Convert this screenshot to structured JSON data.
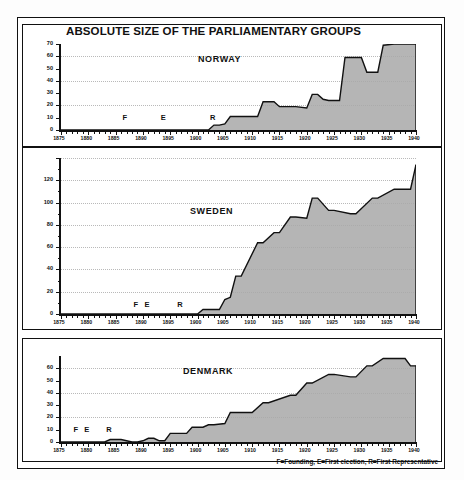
{
  "figure": {
    "title": "ABSOLUTE SIZE OF THE PARLIAMENTARY GROUPS",
    "footnote": "F=Founding, E=First election, R=First Representative",
    "frame_color": "#111111",
    "area_fill": "#a8a8a8",
    "line_color": "#111111",
    "background": "#ffffff"
  },
  "chart_data": [
    {
      "type": "area",
      "title": "ABSOLUTE SIZE OF THE PARLIAMENTARY GROUPS",
      "panel": "NORWAY",
      "xlabel": "",
      "ylabel": "",
      "xlim": [
        1875,
        1940
      ],
      "ylim": [
        0,
        70
      ],
      "yticks": [
        0,
        10,
        20,
        30,
        40,
        50,
        60,
        70
      ],
      "ytick_labels": [
        "0",
        "10",
        "20",
        "30",
        "40",
        "50",
        "60",
        "70"
      ],
      "xticks": [
        1875,
        1880,
        1885,
        1890,
        1895,
        1900,
        1905,
        1910,
        1915,
        1920,
        1925,
        1930,
        1935,
        1940
      ],
      "xtick_labels": [
        "1875",
        "1880",
        "1885",
        "1890",
        "1895",
        "1900",
        "1905",
        "1910",
        "1915",
        "1920",
        "1925",
        "1930",
        "1935",
        "1940"
      ],
      "grid": true,
      "gridlines_at": [
        20,
        40,
        60
      ],
      "annotations": [
        {
          "text": "F",
          "x": 1887,
          "y": 9
        },
        {
          "text": "E",
          "x": 1894,
          "y": 9
        },
        {
          "text": "R",
          "x": 1903,
          "y": 9
        }
      ],
      "x": [
        1875,
        1902,
        1903,
        1904,
        1905,
        1906,
        1909,
        1910,
        1911,
        1912,
        1913,
        1914,
        1915,
        1917,
        1918,
        1920,
        1921,
        1922,
        1923,
        1924,
        1926,
        1927,
        1928,
        1930,
        1931,
        1932,
        1933,
        1934,
        1936,
        1940
      ],
      "values": [
        0,
        0,
        4,
        4,
        5,
        11,
        11,
        11,
        11,
        23,
        23,
        23,
        19,
        19,
        19,
        18,
        29,
        29,
        25,
        24,
        24,
        59,
        59,
        59,
        47,
        47,
        47,
        69,
        70,
        70
      ]
    },
    {
      "type": "area",
      "panel": "SWEDEN",
      "xlabel": "",
      "ylabel": "",
      "xlim": [
        1875,
        1940
      ],
      "ylim": [
        0,
        140
      ],
      "yticks": [
        0,
        20,
        40,
        60,
        80,
        100,
        120,
        140
      ],
      "ytick_labels": [
        "0",
        "20",
        "40",
        "60",
        "80",
        "100",
        "120",
        ""
      ],
      "xticks": [
        1875,
        1880,
        1885,
        1890,
        1895,
        1900,
        1905,
        1910,
        1915,
        1920,
        1925,
        1930,
        1935,
        1940
      ],
      "xtick_labels": [
        "1875",
        "1880",
        "1885",
        "1890",
        "1895",
        "1900",
        "1905",
        "1910",
        "1915",
        "1920",
        "1925",
        "1930",
        "1935",
        "1940"
      ],
      "grid": true,
      "gridlines_at": [
        20,
        40,
        60,
        80,
        100,
        120,
        140
      ],
      "annotations": [
        {
          "text": "F",
          "x": 1889,
          "y": 7
        },
        {
          "text": "E",
          "x": 1891,
          "y": 7
        },
        {
          "text": "R",
          "x": 1897,
          "y": 7
        }
      ],
      "x": [
        1875,
        1900,
        1901,
        1902,
        1904,
        1905,
        1906,
        1907,
        1908,
        1911,
        1912,
        1914,
        1915,
        1917,
        1918,
        1920,
        1921,
        1922,
        1924,
        1925,
        1928,
        1929,
        1932,
        1933,
        1936,
        1937,
        1939,
        1940
      ],
      "values": [
        0,
        0,
        4,
        4,
        4,
        13,
        15,
        34,
        34,
        64,
        64,
        73,
        73,
        87,
        87,
        86,
        104,
        104,
        93,
        93,
        90,
        90,
        104,
        104,
        112,
        112,
        112,
        134
      ]
    },
    {
      "type": "area",
      "panel": "DENMARK",
      "xlabel": "",
      "ylabel": "",
      "xlim": [
        1875,
        1940
      ],
      "ylim": [
        0,
        70
      ],
      "yticks": [
        0,
        10,
        20,
        30,
        40,
        50,
        60
      ],
      "ytick_labels": [
        "0",
        "10",
        "20",
        "30",
        "40",
        "50",
        "60"
      ],
      "xticks": [
        1875,
        1880,
        1885,
        1890,
        1895,
        1900,
        1905,
        1910,
        1915,
        1920,
        1925,
        1930,
        1935,
        1940
      ],
      "xtick_labels": [
        "1875",
        "1880",
        "1885",
        "1890",
        "1895",
        "1900",
        "1905",
        "1910",
        "1915",
        "1920",
        "1925",
        "1930",
        "1935",
        "1940"
      ],
      "grid": true,
      "gridlines_at": [
        20,
        40,
        60
      ],
      "annotations": [
        {
          "text": "F",
          "x": 1878,
          "y": 9
        },
        {
          "text": "E",
          "x": 1880,
          "y": 9
        },
        {
          "text": "R",
          "x": 1884,
          "y": 9
        }
      ],
      "x": [
        1875,
        1883,
        1884,
        1885,
        1886,
        1887,
        1888,
        1889,
        1890,
        1891,
        1892,
        1893,
        1894,
        1895,
        1898,
        1899,
        1901,
        1902,
        1903,
        1905,
        1906,
        1909,
        1910,
        1912,
        1913,
        1917,
        1918,
        1920,
        1921,
        1924,
        1925,
        1928,
        1929,
        1931,
        1932,
        1934,
        1935,
        1938,
        1939,
        1940
      ],
      "values": [
        0,
        0,
        2,
        2,
        2,
        1,
        0,
        0,
        1,
        3,
        3,
        1,
        1,
        7,
        7,
        12,
        12,
        14,
        14,
        15,
        24,
        24,
        24,
        32,
        32,
        38,
        38,
        48,
        48,
        55,
        55,
        53,
        53,
        62,
        62,
        68,
        68,
        68,
        62,
        62
      ]
    }
  ],
  "panels": [
    {
      "name": "NORWAY"
    },
    {
      "name": "SWEDEN"
    },
    {
      "name": "DENMARK"
    }
  ]
}
